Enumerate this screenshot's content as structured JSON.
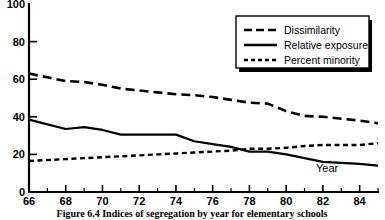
{
  "chart_data": {
    "type": "line",
    "title": "",
    "xlabel": "Year",
    "ylabel": "",
    "xlim": [
      66,
      85
    ],
    "ylim": [
      0,
      100
    ],
    "grid": false,
    "legend_position": "top-right",
    "x_tick_labels": [
      "66",
      "68",
      "70",
      "72",
      "74",
      "76",
      "78",
      "80",
      "82",
      "84"
    ],
    "x_tick_values": [
      66,
      68,
      70,
      72,
      74,
      76,
      78,
      80,
      82,
      84
    ],
    "x_minor_ticks": [
      67,
      69,
      71,
      73,
      75,
      77,
      79,
      81,
      83,
      85
    ],
    "y_tick_labels": [
      "0",
      "20",
      "40",
      "60",
      "80",
      "100"
    ],
    "y_tick_values": [
      0,
      20,
      40,
      60,
      80,
      100
    ],
    "x": [
      66,
      67,
      68,
      69,
      70,
      71,
      72,
      73,
      74,
      75,
      76,
      77,
      78,
      79,
      80,
      81,
      82,
      83,
      84,
      85
    ],
    "series": [
      {
        "name": "Dissimilarity",
        "style": "long-dashed",
        "values": [
          63,
          61,
          59,
          58.5,
          57,
          55,
          54,
          53,
          52,
          51.5,
          50.5,
          49,
          47.5,
          47,
          43,
          40.5,
          40,
          39,
          38,
          36.5
        ]
      },
      {
        "name": "Relative exposure",
        "style": "solid",
        "values": [
          38.5,
          36,
          33.5,
          34.5,
          33,
          30.5,
          30.5,
          30.5,
          30.5,
          27,
          25.5,
          24,
          21.5,
          21.5,
          20,
          18,
          16,
          15.5,
          15,
          14
        ]
      },
      {
        "name": "Percent minority",
        "style": "short-dashed",
        "values": [
          16.5,
          17,
          17.5,
          18,
          18.5,
          19,
          19.5,
          20,
          20.5,
          21,
          21.5,
          22,
          23,
          23,
          23.5,
          24.5,
          25,
          25,
          25,
          26
        ]
      }
    ]
  },
  "legend": {
    "items": [
      {
        "label": "Dissimilarity",
        "style": "long-dashed"
      },
      {
        "label": "Relative exposure",
        "style": "solid"
      },
      {
        "label": "Percent minority",
        "style": "short-dashed"
      }
    ]
  },
  "axis": {
    "x_axis_name": "Year"
  },
  "caption": {
    "text": "Figure 6.4   Indices of segregation by year for elementary schools"
  }
}
